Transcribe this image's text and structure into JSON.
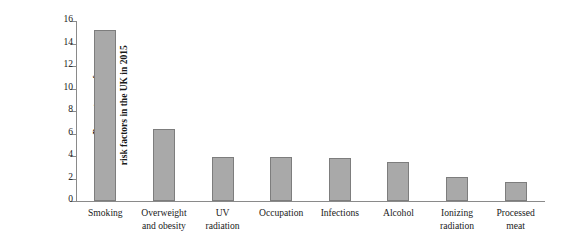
{
  "chart_data": {
    "type": "bar",
    "title": "",
    "subtitle": "",
    "xlabel": "",
    "ylabel": "Percentages of cancer attributable to modifiable risk factors in the UK in 2015",
    "ylabel_lines": [
      "Percentages of",
      "cancer attributable to modifiable",
      "risk factors in the UK in 2015"
    ],
    "categories": [
      "Smoking",
      "Overweight and obesity",
      "UV radiation",
      "Occupation",
      "Infections",
      "Alcohol",
      "Ionizing radiation",
      "Processed meat"
    ],
    "category_lines": [
      [
        "Smoking"
      ],
      [
        "Overweight",
        "and obesity"
      ],
      [
        "UV",
        "radiation"
      ],
      [
        "Occupation"
      ],
      [
        "Infections"
      ],
      [
        "Alcohol"
      ],
      [
        "Ionizing",
        "radiation"
      ],
      [
        "Processed",
        "meat"
      ]
    ],
    "values": [
      15.2,
      6.4,
      3.9,
      3.9,
      3.8,
      3.5,
      2.1,
      1.7
    ],
    "ylim": [
      0,
      16
    ],
    "ytick_values": [
      0,
      2,
      4,
      6,
      8,
      10,
      12,
      14,
      16
    ],
    "ytick_labels": [
      "0",
      "2",
      "4",
      "6",
      "8",
      "10",
      "12",
      "14",
      "16"
    ],
    "grid": false,
    "legend": false,
    "legend_position": "none",
    "bar_color": "#a9a9a9",
    "bar_border_color": "#7d7d7d",
    "axis_color": "#8a8a8a",
    "text_color": "#1a1a1a",
    "background_color": "#ffffff"
  }
}
